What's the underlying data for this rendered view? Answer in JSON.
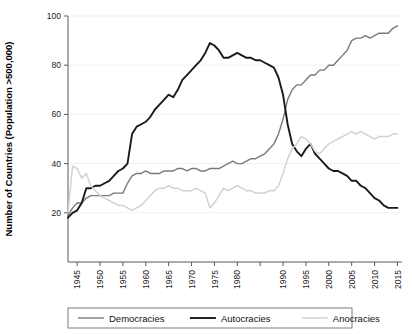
{
  "chart_data": {
    "type": "line",
    "title": "",
    "xlabel": "",
    "ylabel": "Number of Countries (Population >500,000)",
    "xlim": [
      1943,
      2016
    ],
    "ylim": [
      0,
      100
    ],
    "grid": true,
    "legend_position": "bottom",
    "yticks": [
      20,
      40,
      60,
      80,
      100
    ],
    "ytick_labels": [
      "20",
      "40",
      "60",
      "80",
      "100"
    ],
    "xticks": [
      1945,
      1950,
      1955,
      1960,
      1965,
      1970,
      1975,
      1980,
      1985,
      1990,
      1995,
      2000,
      2005,
      2010,
      2015
    ],
    "xtick_labels": [
      "1945",
      "1950",
      "1955",
      "1960",
      "1965",
      "1970",
      "1975",
      "1980",
      "",
      "1990",
      "1995",
      "2000",
      "2005",
      "2010",
      "2015"
    ],
    "x": [
      1943,
      1944,
      1945,
      1946,
      1947,
      1948,
      1949,
      1950,
      1951,
      1952,
      1953,
      1954,
      1955,
      1956,
      1957,
      1958,
      1959,
      1960,
      1961,
      1962,
      1963,
      1964,
      1965,
      1966,
      1967,
      1968,
      1969,
      1970,
      1971,
      1972,
      1973,
      1974,
      1975,
      1976,
      1977,
      1978,
      1979,
      1980,
      1981,
      1982,
      1983,
      1984,
      1985,
      1986,
      1987,
      1988,
      1989,
      1990,
      1991,
      1992,
      1993,
      1994,
      1995,
      1996,
      1997,
      1998,
      1999,
      2000,
      2001,
      2002,
      2003,
      2004,
      2005,
      2006,
      2007,
      2008,
      2009,
      2010,
      2011,
      2012,
      2013,
      2014,
      2015
    ],
    "series": [
      {
        "name": "Democracies",
        "color": "#7a7a7a",
        "width": 1.4,
        "values": [
          19,
          22,
          24,
          24,
          26,
          27,
          27,
          27,
          27,
          27,
          28,
          28,
          28,
          32,
          35,
          36,
          36,
          37,
          36,
          36,
          36,
          37,
          37,
          37,
          38,
          38,
          37,
          38,
          38,
          37,
          37,
          38,
          38,
          38,
          39,
          40,
          41,
          40,
          40,
          41,
          42,
          42,
          43,
          44,
          46,
          48,
          52,
          58,
          66,
          70,
          72,
          72,
          74,
          76,
          76,
          78,
          78,
          80,
          80,
          82,
          84,
          86,
          90,
          91,
          91,
          92,
          91,
          92,
          93,
          93,
          93,
          95,
          96
        ]
      },
      {
        "name": "Autocracies",
        "color": "#1a1a1a",
        "width": 1.9,
        "values": [
          18,
          20,
          21,
          24,
          30,
          30,
          31,
          31,
          32,
          33,
          35,
          37,
          38,
          40,
          52,
          55,
          56,
          57,
          59,
          62,
          64,
          66,
          68,
          67,
          70,
          74,
          76,
          78,
          80,
          82,
          85,
          89,
          88,
          86,
          83,
          83,
          84,
          85,
          84,
          83,
          83,
          82,
          82,
          81,
          80,
          79,
          75,
          68,
          56,
          48,
          45,
          43,
          46,
          48,
          44,
          42,
          40,
          38,
          37,
          37,
          36,
          35,
          33,
          33,
          31,
          30,
          28,
          26,
          25,
          23,
          22,
          22,
          22
        ]
      },
      {
        "name": "Anocracies",
        "color": "#d2d2d2",
        "width": 1.5,
        "values": [
          20,
          39,
          38,
          34,
          36,
          31,
          29,
          27,
          26,
          25,
          24,
          23,
          23,
          22,
          21,
          22,
          23,
          25,
          27,
          29,
          30,
          30,
          31,
          30,
          30,
          29,
          29,
          29,
          30,
          29,
          28,
          22,
          24,
          27,
          30,
          29,
          30,
          31,
          30,
          29,
          29,
          28,
          28,
          28,
          29,
          29,
          31,
          36,
          42,
          46,
          48,
          51,
          50,
          48,
          45,
          44,
          46,
          48,
          49,
          50,
          51,
          52,
          53,
          52,
          53,
          52,
          51,
          50,
          51,
          51,
          51,
          52,
          52
        ]
      }
    ],
    "legend": [
      {
        "label": "Democracies",
        "color": "#7a7a7a",
        "width": 1.4
      },
      {
        "label": "Autocracies",
        "color": "#1a1a1a",
        "width": 1.9
      },
      {
        "label": "Anocracies",
        "color": "#d2d2d2",
        "width": 1.5
      }
    ]
  },
  "layout": {
    "plot_left": 68,
    "plot_right": 402,
    "plot_top": 16,
    "plot_bottom": 262,
    "legend_x": 68,
    "legend_y": 308,
    "legend_w": 284,
    "legend_h": 20
  }
}
